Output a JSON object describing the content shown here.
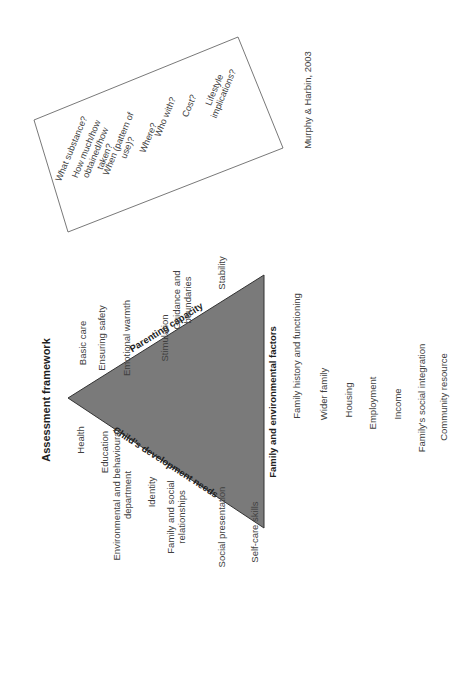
{
  "title": "Assessment framework",
  "citation": "Murphy & Harbin, 2003",
  "triangle": {
    "fill": "#7a7a7a",
    "sides": {
      "childs_development_needs": "Child's development needs",
      "parenting_capacity": "Parenting capacity",
      "family_environmental_factors": "Family and environmental factors"
    }
  },
  "childs_development_needs": [
    [
      "Health"
    ],
    [
      "Education"
    ],
    [
      "Environmental and behavioural",
      "department"
    ],
    [
      "Identity"
    ],
    [
      "Family and social",
      "relationships"
    ],
    [
      "Social presentation"
    ],
    [
      "Self-care skills"
    ]
  ],
  "parenting_capacity": [
    [
      "Basic care"
    ],
    [
      "Ensuring safety"
    ],
    [
      "Emotional warmth"
    ],
    [
      "Stimulation"
    ],
    [
      "Guidance and",
      "boundaries"
    ],
    [
      "Stability"
    ]
  ],
  "family_environmental_factors": [
    "Family history and functioning",
    "Wider family",
    "Housing",
    "Employment",
    "Income",
    "Family's social integration",
    "Community resource"
  ],
  "substance_questions": [
    [
      "What substance?"
    ],
    [
      "How much/how",
      "obtained/how",
      "taken?"
    ],
    [
      "When (pattern of",
      "use)?"
    ],
    [
      "Where?"
    ],
    [
      "Who with?"
    ],
    [
      "Cost?"
    ],
    [
      "Lifestyle",
      "implications?"
    ]
  ]
}
